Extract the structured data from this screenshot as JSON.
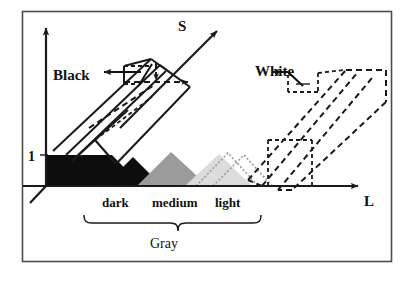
{
  "figure": {
    "frame": {
      "border_color": "#4d4d4d"
    },
    "axes": {
      "vertical": {
        "name": "saturation-black-axis",
        "label": "Black"
      },
      "diagonal": {
        "name": "s-axis",
        "label": "S"
      },
      "horizontal": {
        "name": "l-axis",
        "label": "L"
      },
      "tick": {
        "label": "1"
      }
    },
    "annotations": {
      "black_label": "Black",
      "white_label": "White",
      "gray_label": "Gray",
      "s_label": "S",
      "l_label": "L",
      "one_label": "1"
    },
    "bands": [
      {
        "key": "dark",
        "label": "dark",
        "fill": "#0d0d0d"
      },
      {
        "key": "medium",
        "label": "medium",
        "fill": "#9b9b9b"
      },
      {
        "key": "light",
        "label": "light",
        "fill": "#dcdcdc"
      }
    ],
    "brace": {
      "name": "gray-brace",
      "spans": [
        "dark",
        "medium",
        "light"
      ],
      "label": "Gray"
    },
    "solids": [
      {
        "name": "black-prism",
        "style": "solid",
        "pointer_label": "Black"
      },
      {
        "name": "white-prism",
        "style": "dashed",
        "pointer_label": "White"
      }
    ],
    "colors": {
      "ink": "#1a1a1a",
      "frame": "#4d4d4d",
      "dark_band": "#0d0d0d",
      "medium_band": "#9b9b9b",
      "light_band": "#dcdcdc",
      "ghost": "#9a9a9a"
    }
  }
}
